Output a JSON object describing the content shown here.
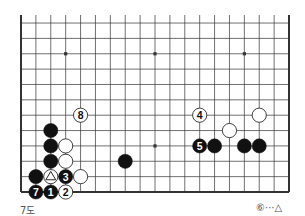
{
  "diagram": {
    "type": "go-board",
    "board_size": 19,
    "visible_rows": 12,
    "visible_cols": 19,
    "caption": "7도",
    "note": "⑥···△",
    "colors": {
      "line": "#333333",
      "black": "#111111",
      "white": "#ffffff",
      "text_on_black": "#ffffff",
      "text_on_white": "#111111"
    },
    "star_points": [
      {
        "col": 3,
        "row": 10
      },
      {
        "col": 9,
        "row": 10
      },
      {
        "col": 15,
        "row": 10
      },
      {
        "col": 9,
        "row": 4
      }
    ],
    "stones": [
      {
        "color": "black",
        "col": 2,
        "row": 5,
        "label": ""
      },
      {
        "color": "black",
        "col": 2,
        "row": 4,
        "label": ""
      },
      {
        "color": "black",
        "col": 2,
        "row": 3,
        "label": ""
      },
      {
        "color": "white",
        "col": 3,
        "row": 4,
        "label": ""
      },
      {
        "color": "white",
        "col": 3,
        "row": 3,
        "label": ""
      },
      {
        "color": "black",
        "col": 1,
        "row": 2,
        "label": ""
      },
      {
        "color": "white",
        "col": 2,
        "row": 2,
        "label": "△"
      },
      {
        "color": "black",
        "col": 3,
        "row": 2,
        "label": "3"
      },
      {
        "color": "white",
        "col": 4,
        "row": 2,
        "label": ""
      },
      {
        "color": "black",
        "col": 1,
        "row": 1,
        "label": "7"
      },
      {
        "color": "black",
        "col": 2,
        "row": 1,
        "label": "1"
      },
      {
        "color": "white",
        "col": 3,
        "row": 1,
        "label": "2"
      },
      {
        "color": "white",
        "col": 4,
        "row": 6,
        "label": "8"
      },
      {
        "color": "black",
        "col": 7,
        "row": 3,
        "label": ""
      },
      {
        "color": "white",
        "col": 12,
        "row": 6,
        "label": "4"
      },
      {
        "color": "white",
        "col": 16,
        "row": 6,
        "label": ""
      },
      {
        "color": "white",
        "col": 14,
        "row": 5,
        "label": ""
      },
      {
        "color": "black",
        "col": 12,
        "row": 4,
        "label": "5"
      },
      {
        "color": "black",
        "col": 13,
        "row": 4,
        "label": ""
      },
      {
        "color": "black",
        "col": 15,
        "row": 4,
        "label": ""
      },
      {
        "color": "black",
        "col": 16,
        "row": 4,
        "label": ""
      }
    ]
  }
}
